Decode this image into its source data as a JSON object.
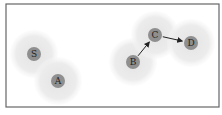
{
  "diagram": {
    "frame": {
      "x": 6,
      "y": 4,
      "width": 213,
      "height": 103,
      "stroke": "#666666"
    },
    "halo_color": "#e8e8e8",
    "node_color": "#8f8f8f",
    "edge_color": "#222222",
    "nodes": [
      {
        "id": "S",
        "label": "S",
        "x": 34,
        "y": 54
      },
      {
        "id": "A",
        "label": "A",
        "x": 58,
        "y": 81
      },
      {
        "id": "B",
        "label": "B",
        "x": 133,
        "y": 62
      },
      {
        "id": "C",
        "label": "C",
        "x": 155,
        "y": 35
      },
      {
        "id": "D",
        "label": "D",
        "x": 191,
        "y": 43
      }
    ],
    "edges": [
      {
        "from": "B",
        "to": "C"
      },
      {
        "from": "C",
        "to": "D"
      }
    ]
  }
}
